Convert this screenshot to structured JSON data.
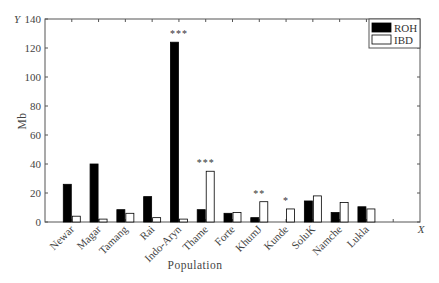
{
  "chart_data": {
    "type": "bar",
    "title": "",
    "xlabel": "Population",
    "ylabel": "Mb",
    "x_axis_marker": "X",
    "y_axis_marker": "Y",
    "ylim": [
      0,
      140
    ],
    "yticks": [
      0,
      20,
      40,
      60,
      80,
      100,
      120,
      140
    ],
    "grid": false,
    "legend_position": "top-right",
    "categories": [
      "Newar",
      "Magar",
      "Tamang",
      "Rai",
      "Indo-Aryn",
      "Thame",
      "Forte",
      "KhumJ",
      "Kunde",
      "SoluK",
      "Namche",
      "Lukla"
    ],
    "series": [
      {
        "name": "ROH",
        "color": "#000000",
        "values": [
          26,
          40,
          8.5,
          17.5,
          124,
          8.5,
          6,
          3,
          0,
          14.5,
          6.5,
          10.5
        ]
      },
      {
        "name": "IBD",
        "color": "#ffffff",
        "values": [
          4,
          2,
          6,
          3,
          2,
          35,
          6.5,
          14,
          9,
          18,
          13.5,
          9
        ]
      }
    ],
    "annotations": [
      {
        "category": "Indo-Aryn",
        "text": "***"
      },
      {
        "category": "Thame",
        "text": "***"
      },
      {
        "category": "KhumJ",
        "text": "**"
      },
      {
        "category": "Kunde",
        "text": "*"
      }
    ]
  }
}
